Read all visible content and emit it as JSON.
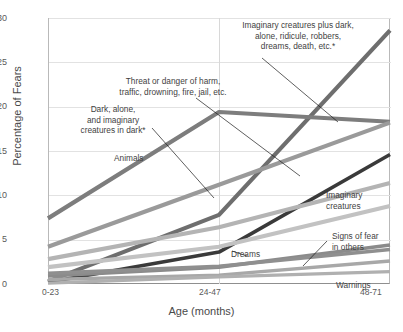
{
  "chart_data": {
    "type": "line",
    "title": "",
    "xlabel": "Age  (months)",
    "ylabel": "Percentage of Fears",
    "categories": [
      "0-23",
      "24-47",
      "48-71"
    ],
    "x": [
      0,
      1,
      2
    ],
    "ylim": [
      0,
      30
    ],
    "yticks": [
      0,
      5,
      10,
      15,
      20,
      25,
      30
    ],
    "grid": "horizontal",
    "legend": "annotations-inline",
    "series": [
      {
        "name": "Imaginary creatures plus dark, alone, ridicule, robbers, dreams, death, etc.*",
        "values": [
          0.3,
          7.8,
          28.6
        ],
        "color": "#6e6e6e",
        "width": 4.2
      },
      {
        "name": "Animals",
        "values": [
          7.4,
          19.4,
          18.3
        ],
        "color": "#7d7d7d",
        "width": 4.2
      },
      {
        "name": "Imaginary creatures",
        "values": [
          4.2,
          11.2,
          18.2
        ],
        "color": "#9a9a9a",
        "width": 4.2
      },
      {
        "name": "Threat or danger of harm, traffic, drowning, fire, jail, etc.",
        "values": [
          0.2,
          3.6,
          14.6
        ],
        "color": "#3a3a3a",
        "width": 3.6
      },
      {
        "name": "Dark, alone, and imaginary creatures in dark*",
        "values": [
          2.8,
          6.4,
          11.4
        ],
        "color": "#b4b4b4",
        "width": 4.2
      },
      {
        "name": "Signs of fear in others",
        "values": [
          1.9,
          4.2,
          8.8
        ],
        "color": "#c2c2c2",
        "width": 4.2
      },
      {
        "name": "Dreams",
        "values": [
          0.9,
          1.9,
          4.4
        ],
        "color": "#8b8b8b",
        "width": 3.6
      },
      {
        "name": "Warnings",
        "values": [
          1.2,
          2.0,
          3.9
        ],
        "color": "#8f8f8f",
        "width": 3.6
      },
      {
        "name": "unlabeled-low-a",
        "values": [
          0.5,
          1.0,
          2.6
        ],
        "color": "#a8a8a8",
        "width": 3.4
      },
      {
        "name": "unlabeled-low-b",
        "values": [
          0.1,
          0.8,
          1.4
        ],
        "color": "#b0b0b0",
        "width": 3.4
      }
    ],
    "annotations": [
      {
        "name": "imaginary-plus-dark",
        "text": "Imaginary creatures plus dark,\nalone, ridicule, robbers,\ndreams, death, etc.*"
      },
      {
        "name": "threat-of-harm",
        "text": "Threat or danger of harm,\ntraffic, drowning, fire, jail, etc."
      },
      {
        "name": "dark-alone-in-dark",
        "text": "Dark, alone,\nand imaginary\ncreatures in dark*"
      },
      {
        "name": "animals",
        "text": "Animals"
      },
      {
        "name": "imaginary-creatures",
        "text": "Imaginary\ncreatures"
      },
      {
        "name": "signs-of-fear",
        "text": "Signs of fear\nin others"
      },
      {
        "name": "dreams",
        "text": "Dreams"
      },
      {
        "name": "warnings",
        "text": "Warnings"
      }
    ]
  },
  "axis": {
    "yticks": [
      "30",
      "25",
      "20",
      "15",
      "10",
      "5",
      "0"
    ],
    "xticks": [
      "0-23",
      "24-47",
      "48-71"
    ],
    "xtitle": "Age  (months)",
    "ytitle": "Percentage of Fears"
  },
  "ann_text": {
    "imaginary_plus_dark_1": "Imaginary creatures plus dark,",
    "imaginary_plus_dark_2": "alone, ridicule, robbers,",
    "imaginary_plus_dark_3": "dreams, death, etc.*",
    "threat_1": "Threat or danger of harm,",
    "threat_2": "traffic, drowning, fire, jail, etc.",
    "dark_1": "Dark, alone,",
    "dark_2": "and imaginary",
    "dark_3": "creatures in dark*",
    "animals": "Animals",
    "imaginary_1": "Imaginary",
    "imaginary_2": "creatures",
    "signs_1": "Signs of fear",
    "signs_2": "in others",
    "dreams": "Dreams",
    "warnings": "Warnings"
  }
}
